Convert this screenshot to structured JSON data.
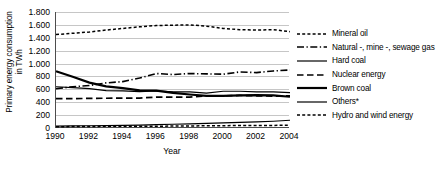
{
  "chart_data": {
    "type": "line",
    "title": "",
    "xlabel": "Year",
    "ylabel": "Primary energy consumption in TWh",
    "ylabel_line1": "Primary energy consumption",
    "ylabel_line2": "in TWh",
    "x": [
      1990,
      1991,
      1992,
      1993,
      1994,
      1995,
      1996,
      1997,
      1998,
      1999,
      2000,
      2001,
      2002,
      2003,
      2004
    ],
    "xtick_labels": [
      "1990",
      "1992",
      "1994",
      "1996",
      "1998",
      "2000",
      "2002",
      "2004"
    ],
    "xtick_values": [
      1990,
      1992,
      1994,
      1996,
      1998,
      2000,
      2002,
      2004
    ],
    "xlim": [
      1990,
      2004
    ],
    "ylim": [
      0,
      1800
    ],
    "ytick_labels": [
      "0",
      "200",
      "400",
      "600",
      "800",
      "1.000",
      "1.200",
      "1.400",
      "1.600",
      "1.800"
    ],
    "ytick_values": [
      0,
      200,
      400,
      600,
      800,
      1000,
      1200,
      1400,
      1600,
      1800
    ],
    "grid": "horizontal",
    "legend_position": "right",
    "footnote_marker": "*",
    "series": [
      {
        "name": "Mineral oil",
        "style": "dotted",
        "values": [
          1450,
          1470,
          1490,
          1520,
          1545,
          1570,
          1590,
          1595,
          1600,
          1580,
          1545,
          1525,
          1520,
          1525,
          1495
        ]
      },
      {
        "name": "Natural -, mine -, sewage gas",
        "style": "dash-dot",
        "values": [
          610,
          640,
          660,
          700,
          720,
          775,
          845,
          830,
          845,
          840,
          835,
          870,
          860,
          885,
          900
        ]
      },
      {
        "name": "Hard coal",
        "style": "solid-thin",
        "values": [
          640,
          625,
          610,
          580,
          575,
          565,
          575,
          560,
          560,
          540,
          570,
          570,
          560,
          560,
          550
        ]
      },
      {
        "name": "Nuclear energy",
        "style": "dashed",
        "values": [
          455,
          455,
          460,
          462,
          465,
          465,
          480,
          480,
          480,
          500,
          500,
          505,
          500,
          495,
          500
        ]
      },
      {
        "name": "Brown coal",
        "style": "solid-thick",
        "values": [
          880,
          795,
          705,
          645,
          620,
          585,
          580,
          545,
          520,
          500,
          500,
          505,
          510,
          505,
          485
        ]
      },
      {
        "name": "Others",
        "style": "solid-thin",
        "values": [
          30,
          32,
          35,
          38,
          42,
          45,
          52,
          58,
          65,
          72,
          80,
          88,
          95,
          105,
          120
        ]
      },
      {
        "name": "Hydro and wind energy",
        "style": "dotted",
        "values": [
          20,
          22,
          24,
          26,
          28,
          28,
          28,
          30,
          32,
          34,
          36,
          38,
          40,
          40,
          44
        ]
      }
    ]
  },
  "legend": {
    "items": [
      {
        "label": "Mineral oil",
        "style": "dotted"
      },
      {
        "label": "Natural -, mine -, sewage gas",
        "style": "dash-dot"
      },
      {
        "label": "Hard coal",
        "style": "solid-thin"
      },
      {
        "label": "Nuclear energy",
        "style": "dashed"
      },
      {
        "label": "Brown coal",
        "style": "solid-thick"
      },
      {
        "label": "Others*",
        "style": "solid-thin"
      },
      {
        "label": "Hydro and wind energy",
        "style": "dotted"
      }
    ]
  },
  "colors": {
    "line": "#000000",
    "grid": "#c6c6c6",
    "axis": "#4d4d4d",
    "background": "#ffffff"
  }
}
